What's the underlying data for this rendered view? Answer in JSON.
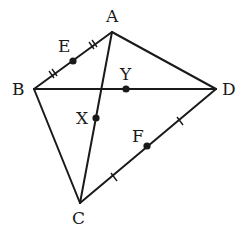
{
  "diagram": {
    "type": "geometry-quadrilateral",
    "vertices": [
      {
        "id": "A",
        "label": "A",
        "x": 112,
        "y": 32,
        "lx": 106,
        "ly": 22
      },
      {
        "id": "B",
        "label": "B",
        "x": 34,
        "y": 89,
        "lx": 12,
        "ly": 95
      },
      {
        "id": "C",
        "label": "C",
        "x": 80,
        "y": 203,
        "lx": 72,
        "ly": 224
      },
      {
        "id": "D",
        "label": "D",
        "x": 216,
        "y": 89,
        "lx": 222,
        "ly": 95
      }
    ],
    "points": [
      {
        "id": "E",
        "label": "E",
        "x": 73,
        "y": 61,
        "lx": 58,
        "ly": 52
      },
      {
        "id": "X",
        "label": "X",
        "x": 96,
        "y": 118,
        "lx": 76,
        "ly": 124
      },
      {
        "id": "Y",
        "label": "Y",
        "x": 126,
        "y": 89,
        "lx": 120,
        "ly": 80
      },
      {
        "id": "F",
        "label": "F",
        "x": 147,
        "y": 146,
        "lx": 132,
        "ly": 142
      }
    ],
    "segments": [
      "AB",
      "AD",
      "BD",
      "BC",
      "CD",
      "AC"
    ],
    "tick_marks": [
      {
        "segment": "AE",
        "count": 2
      },
      {
        "segment": "EB",
        "count": 2
      },
      {
        "segment": "CF",
        "count": 1
      },
      {
        "segment": "FD",
        "count": 1
      }
    ]
  }
}
